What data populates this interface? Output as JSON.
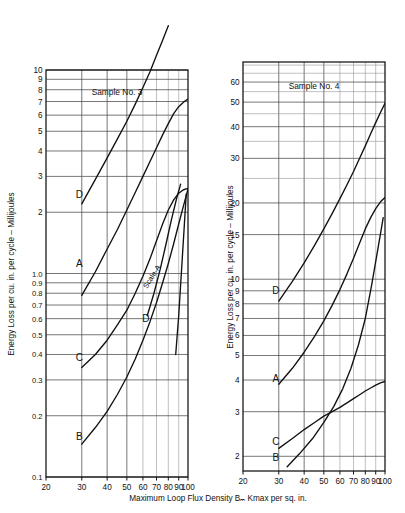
{
  "figure": {
    "xlabel": "Maximum Loop Flux Density Bₘ Kmax per sq. in.",
    "ylabel": "Energy Loss per cu. in. per cycle – Millijoules",
    "line_color": "#111111",
    "grid_color": "#4a4a4a"
  },
  "chart_data": [
    {
      "type": "line",
      "title": "Sample No. 3",
      "xlabel": "Maximum Loop Flux Density Bₘ Kmax per sq. in.",
      "ylabel": "Energy Loss per cu. in. per cycle – Millijoules",
      "xscale": "log",
      "yscale": "log",
      "xlim": [
        20,
        100
      ],
      "ylim": [
        0.1,
        10
      ],
      "xticks": [
        20,
        30,
        40,
        50,
        60,
        70,
        80,
        90,
        100
      ],
      "xticklabels": [
        "20",
        "30",
        "40",
        "50",
        "60",
        "70",
        "80",
        "90",
        "100"
      ],
      "yticks": [
        0.1,
        0.2,
        0.3,
        0.4,
        0.5,
        0.6,
        0.7,
        0.8,
        0.9,
        1.0,
        2,
        3,
        4,
        5,
        6,
        7,
        8,
        9,
        10
      ],
      "yticklabels": [
        "0.1",
        "0.2",
        "0.3",
        "0.4",
        "0.5",
        "0.6",
        "0.7",
        "0.8",
        "0.9",
        "1.0",
        "2",
        "3",
        "4",
        "5",
        "6",
        "7",
        "8",
        "9",
        "10"
      ],
      "grid": true,
      "annotations": [
        {
          "text": "Scale-A",
          "x": 68,
          "y": 0.95,
          "rotation": -57
        }
      ],
      "series": [
        {
          "name": "D",
          "label": "D",
          "label_x": 29.2,
          "label_y": 2.45,
          "x": [
            30,
            35,
            40,
            45,
            50,
            55,
            60,
            65,
            70,
            75,
            80
          ],
          "y": [
            2.2,
            2.9,
            3.7,
            4.6,
            5.6,
            6.8,
            8.2,
            9.8,
            11.8,
            14.0,
            16.5
          ]
        },
        {
          "name": "A",
          "label": "A",
          "label_x": 29.2,
          "label_y": 1.12,
          "x": [
            30,
            35,
            40,
            45,
            50,
            55,
            60,
            65,
            70,
            75,
            80,
            85,
            90,
            95,
            100
          ],
          "y": [
            0.78,
            1.02,
            1.32,
            1.65,
            2.05,
            2.5,
            3.0,
            3.55,
            4.15,
            4.8,
            5.45,
            6.1,
            6.6,
            6.95,
            7.2
          ]
        },
        {
          "name": "C",
          "label": "C",
          "label_x": 29.2,
          "label_y": 0.385,
          "x": [
            30,
            35,
            40,
            45,
            50,
            55,
            60,
            65,
            70,
            75,
            80,
            85,
            90,
            95,
            100
          ],
          "y": [
            0.345,
            0.4,
            0.47,
            0.56,
            0.66,
            0.8,
            0.97,
            1.18,
            1.45,
            1.75,
            2.05,
            2.3,
            2.48,
            2.58,
            2.62
          ]
        },
        {
          "name": "B",
          "label": "B",
          "label_x": 29.2,
          "label_y": 0.158,
          "x": [
            30,
            35,
            40,
            45,
            50,
            55,
            60,
            65,
            70,
            75,
            80,
            85,
            90,
            95,
            100
          ],
          "y": [
            0.145,
            0.175,
            0.21,
            0.255,
            0.31,
            0.38,
            0.47,
            0.58,
            0.72,
            0.9,
            1.12,
            1.4,
            1.75,
            2.15,
            2.6
          ]
        },
        {
          "name": "D-scale-A",
          "label": "D",
          "label_x": 62,
          "label_y": 0.6,
          "x": [
            63,
            68,
            73,
            78,
            83,
            88,
            92
          ],
          "y": [
            0.62,
            0.8,
            1.05,
            1.4,
            1.85,
            2.35,
            2.75
          ]
        },
        {
          "name": "E",
          "label": "",
          "label_x": null,
          "label_y": null,
          "x": [
            87,
            90,
            93,
            96,
            98
          ],
          "y": [
            0.4,
            0.62,
            1.05,
            1.75,
            2.45
          ]
        }
      ]
    },
    {
      "type": "line",
      "title": "Sample No. 4",
      "xlabel": "Maximum Loop Flux Density Bₘ Kmax per sq. in.",
      "ylabel": "Energy Loss per cu. in. per cycle – Millijoules",
      "xscale": "log",
      "yscale": "log",
      "xlim": [
        20,
        100
      ],
      "ylim": [
        1.75,
        72
      ],
      "xticks": [
        20,
        30,
        40,
        50,
        60,
        70,
        80,
        90,
        100
      ],
      "xticklabels": [
        "20",
        "30",
        "40",
        "50",
        "60",
        "70",
        "80",
        "90",
        "100"
      ],
      "yticks": [
        2,
        3,
        4,
        5,
        6,
        7,
        8,
        9,
        10,
        15,
        20,
        30,
        40,
        50,
        60
      ],
      "yticklabels": [
        "2",
        "3",
        "4",
        "5",
        "6",
        "7",
        "8",
        "9",
        "10",
        "15",
        "20",
        "30",
        "40",
        "50",
        "60"
      ],
      "grid": true,
      "annotations": [],
      "series": [
        {
          "name": "D",
          "label": "D",
          "label_x": 29.0,
          "label_y": 9.0,
          "x": [
            30,
            35,
            40,
            45,
            50,
            55,
            60,
            65,
            70,
            75,
            80,
            85,
            90,
            95,
            100
          ],
          "y": [
            8.2,
            9.8,
            11.6,
            13.6,
            15.8,
            18.2,
            20.8,
            23.6,
            26.6,
            30.0,
            33.6,
            37.5,
            41.5,
            45.5,
            49.5
          ]
        },
        {
          "name": "A",
          "label": "A",
          "label_x": 29.0,
          "label_y": 4.05,
          "x": [
            30,
            35,
            40,
            45,
            50,
            55,
            60,
            65,
            70,
            75,
            80,
            85,
            90,
            95,
            100
          ],
          "y": [
            3.85,
            4.45,
            5.15,
            5.95,
            6.85,
            7.9,
            9.1,
            10.5,
            12.1,
            13.9,
            15.8,
            17.5,
            19.0,
            20.2,
            21.0
          ]
        },
        {
          "name": "C",
          "label": "C",
          "label_x": 29.0,
          "label_y": 2.28,
          "x": [
            30,
            35,
            40,
            45,
            50,
            55,
            60,
            65,
            70,
            75,
            80,
            85,
            90,
            95,
            100
          ],
          "y": [
            2.15,
            2.35,
            2.55,
            2.72,
            2.88,
            3.0,
            3.12,
            3.25,
            3.38,
            3.5,
            3.62,
            3.72,
            3.82,
            3.9,
            3.95
          ]
        },
        {
          "name": "B",
          "label": "B",
          "label_x": 29.0,
          "label_y": 1.97,
          "x": [
            33,
            38,
            44,
            50,
            56,
            62,
            68,
            74,
            80,
            86,
            92,
            98
          ],
          "y": [
            1.82,
            2.05,
            2.35,
            2.72,
            3.15,
            3.7,
            4.45,
            5.5,
            7.0,
            9.5,
            13.0,
            17.5
          ]
        }
      ]
    }
  ]
}
